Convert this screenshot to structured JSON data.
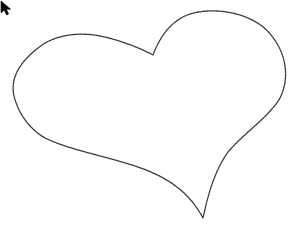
{
  "canvas": {
    "background": "#ffffff",
    "stroke_color": "#3a3a3a",
    "shape": "heart-outline",
    "stroke_style": "dashed-pencil"
  },
  "drawing": {
    "label": "Hand-drawn heart",
    "path_points": {
      "top_dip": [
        153,
        55
      ],
      "left_lobe_top": [
        75,
        34
      ],
      "left_extreme": [
        12,
        80
      ],
      "bottom_cusp": [
        203,
        218
      ],
      "right_extreme": [
        285,
        72
      ],
      "right_lobe_top": [
        212,
        12
      ]
    }
  },
  "cursor": {
    "icon": "arrow-pointer-icon",
    "position": [
      153,
      55
    ],
    "color": "#000000"
  }
}
